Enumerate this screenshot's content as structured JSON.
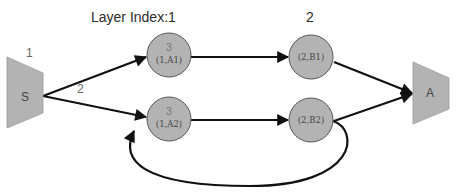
{
  "diagram": {
    "layer_labels": {
      "layer1": "Layer Index:1",
      "layer2": "2"
    },
    "edge_labels": {
      "s_to_a1": "1",
      "s_to_a2": "2"
    },
    "nodes": {
      "source": {
        "label": "S",
        "shape": "trapezoid"
      },
      "a1": {
        "top": "3",
        "label": "(1,A1)",
        "shape": "circle"
      },
      "a2": {
        "top": "3",
        "label": "(1,A2)",
        "shape": "circle"
      },
      "b1": {
        "label": "(2,B1)",
        "shape": "circle"
      },
      "b2": {
        "label": "(2,B2)",
        "shape": "circle"
      },
      "sink": {
        "label": "A",
        "shape": "trapezoid"
      }
    },
    "edges": [
      {
        "from": "S",
        "to": "(1,A1)",
        "label": "1"
      },
      {
        "from": "S",
        "to": "(1,A2)",
        "label": "2"
      },
      {
        "from": "(1,A1)",
        "to": "(2,B1)"
      },
      {
        "from": "(1,A2)",
        "to": "(2,B2)"
      },
      {
        "from": "(2,B1)",
        "to": "A"
      },
      {
        "from": "(2,B2)",
        "to": "A"
      },
      {
        "from": "(2,B2)",
        "to": "(1,A2)",
        "style": "loop-back"
      }
    ],
    "colors": {
      "node_fill": "#b3b3b3",
      "node_stroke": "#555555",
      "edge": "#111111",
      "background": "#ffffff"
    }
  }
}
